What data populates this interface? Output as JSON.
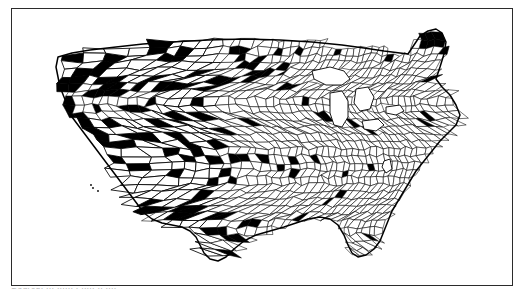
{
  "figure": {
    "kind": "map",
    "projection_hint": "albers-conic-conformal",
    "frame": {
      "border_color": "#2b2b2b",
      "background": "#ffffff",
      "border_width_px": 1.6
    },
    "symbology": {
      "fill_highlight": "#000000",
      "fill_default": "#ffffff",
      "boundary_color": "#000000",
      "highlight_meaning": "county shaded solid black",
      "default_meaning": "county not shaded"
    }
  },
  "caption": {
    "visible_fragment": "Source: ...   ......  .  .....  ..  ....",
    "note": "caption row is clipped by the bottom edge of the screenshot; only letter tips render"
  },
  "map_data": {
    "type": "choropleth",
    "geography": "us-counties",
    "classes": [
      {
        "label": "shaded",
        "color": "#000000"
      },
      {
        "label": "unshaded",
        "color": "#ffffff"
      }
    ],
    "regions": [
      {
        "name": "Pacific Northwest",
        "county_size": "large",
        "shaded_density": "high"
      },
      {
        "name": "Northern Rockies",
        "county_size": "large",
        "shaded_density": "high"
      },
      {
        "name": "Great Basin",
        "county_size": "very-large",
        "shaded_density": "high"
      },
      {
        "name": "Southwest",
        "county_size": "very-large",
        "shaded_density": "moderate"
      },
      {
        "name": "Northern Plains",
        "county_size": "medium",
        "shaded_density": "high"
      },
      {
        "name": "Central Plains",
        "county_size": "small",
        "shaded_density": "low"
      },
      {
        "name": "Texas",
        "county_size": "small",
        "shaded_density": "low"
      },
      {
        "name": "Midwest",
        "county_size": "very-small",
        "shaded_density": "very-low"
      },
      {
        "name": "Southeast",
        "county_size": "very-small",
        "shaded_density": "very-low"
      },
      {
        "name": "Appalachia",
        "county_size": "very-small",
        "shaded_density": "very-low"
      },
      {
        "name": "Northeast",
        "county_size": "small",
        "shaded_density": "low"
      },
      {
        "name": "Northern Maine",
        "county_size": "large",
        "shaded_density": "high"
      },
      {
        "name": "Florida peninsula",
        "county_size": "small",
        "shaded_density": "very-low"
      }
    ],
    "water_features": [
      {
        "name": "Lake Superior"
      },
      {
        "name": "Lake Michigan"
      },
      {
        "name": "Lake Huron"
      },
      {
        "name": "Lake Erie"
      },
      {
        "name": "Lake Ontario"
      },
      {
        "name": "Chesapeake Bay"
      },
      {
        "name": "Gulf of Mexico"
      }
    ]
  }
}
